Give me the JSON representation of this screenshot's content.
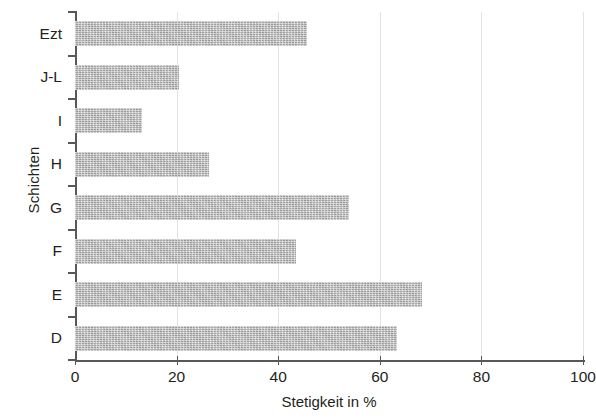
{
  "chart_data": {
    "type": "bar",
    "orientation": "horizontal",
    "title": "",
    "xlabel": "Stetigkeit in %",
    "ylabel": "Schichten",
    "categories": [
      "Ezt",
      "J-L",
      "I",
      "H",
      "G",
      "F",
      "E",
      "D"
    ],
    "values": [
      45.7,
      20.5,
      13.2,
      26.4,
      53.9,
      43.5,
      68.3,
      63.4
    ],
    "xlim": [
      0,
      100
    ],
    "xticks": [
      0,
      20,
      40,
      60,
      80,
      100
    ],
    "xticklabels": [
      "0",
      "20",
      "40",
      "60",
      "80",
      "100"
    ],
    "grid": "vertical",
    "legend": "none",
    "bar_color": "#b9b9b9",
    "axis_color": "#58585a",
    "grid_color": "#e3e3e3",
    "text_color": "#231f20",
    "background": "#ffffff"
  }
}
